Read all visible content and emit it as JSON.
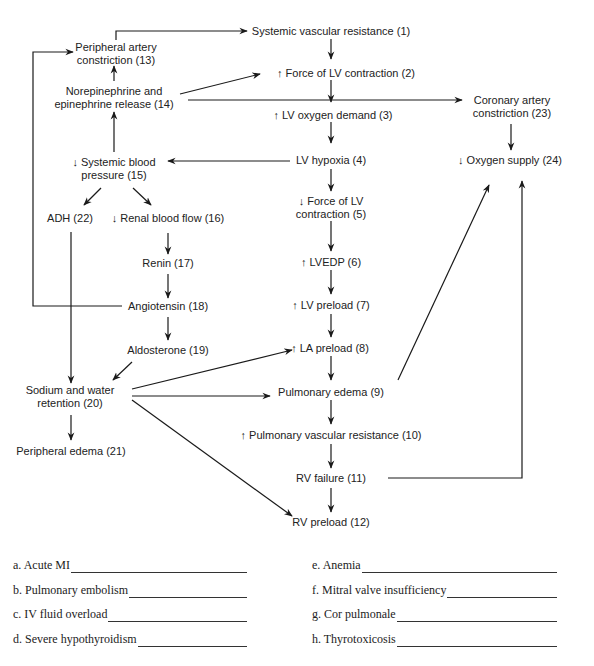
{
  "diagram": {
    "nodes": {
      "n1": "Systemic vascular resistance (1)",
      "n2": "↑ Force of LV contraction (2)",
      "n3": "↑ LV oxygen demand (3)",
      "n4": "LV hypoxia (4)",
      "n5a": "↓ Force of LV",
      "n5b": "contraction (5)",
      "n6": "↑ LVEDP (6)",
      "n7": "↑ LV preload (7)",
      "n8": "↑ LA preload (8)",
      "n9": "Pulmonary edema (9)",
      "n10": "↑ Pulmonary vascular resistance (10)",
      "n11": "RV failure (11)",
      "n12": "RV preload (12)",
      "n13a": "Peripheral artery",
      "n13b": "constriction (13)",
      "n14a": "Norepinephrine and",
      "n14b": "epinephrine release (14)",
      "n15a": "↓ Systemic blood",
      "n15b": "pressure (15)",
      "n16": "↓ Renal blood flow (16)",
      "n17": "Renin (17)",
      "n18": "Angiotensin (18)",
      "n19": "Aldosterone (19)",
      "n20a": "Sodium and water",
      "n20b": "retention (20)",
      "n21": "Peripheral edema (21)",
      "n22": "ADH (22)",
      "n23a": "Coronary artery",
      "n23b": "constriction (23)",
      "n24": "↓ Oxygen supply (24)"
    },
    "edges": [
      [
        "13",
        "1"
      ],
      [
        "1",
        "2"
      ],
      [
        "14",
        "13"
      ],
      [
        "14",
        "2"
      ],
      [
        "14",
        "23"
      ],
      [
        "2",
        "3"
      ],
      [
        "3",
        "4"
      ],
      [
        "4",
        "15"
      ],
      [
        "4",
        "5"
      ],
      [
        "5",
        "6"
      ],
      [
        "6",
        "7"
      ],
      [
        "7",
        "8"
      ],
      [
        "8",
        "9"
      ],
      [
        "9",
        "10"
      ],
      [
        "10",
        "11"
      ],
      [
        "11",
        "12"
      ],
      [
        "9",
        "24"
      ],
      [
        "11",
        "24"
      ],
      [
        "23",
        "24"
      ],
      [
        "15",
        "14"
      ],
      [
        "15",
        "22"
      ],
      [
        "15",
        "16"
      ],
      [
        "16",
        "17"
      ],
      [
        "17",
        "18"
      ],
      [
        "18",
        "13"
      ],
      [
        "18",
        "19"
      ],
      [
        "19",
        "20"
      ],
      [
        "22",
        "20"
      ],
      [
        "20",
        "8"
      ],
      [
        "20",
        "9"
      ],
      [
        "20",
        "12"
      ],
      [
        "20",
        "21"
      ]
    ]
  },
  "questions": {
    "left": [
      "a. Acute MI",
      "b. Pulmonary embolism",
      "c. IV fluid overload",
      "d. Severe hypothyroidism"
    ],
    "right": [
      "e. Anemia",
      "f. Mitral valve insufficiency",
      "g. Cor pulmonale",
      "h. Thyrotoxicosis"
    ]
  }
}
